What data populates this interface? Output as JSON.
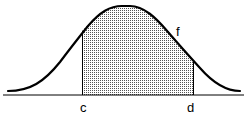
{
  "figure": {
    "type": "normal distribution curve with shaded area",
    "curve_label": "f",
    "left_bound_label": "c",
    "right_bound_label": "d",
    "shading": "dotted",
    "colors": {
      "line": "#000000",
      "fill_dots": "#444444",
      "background": "#ffffff"
    }
  }
}
